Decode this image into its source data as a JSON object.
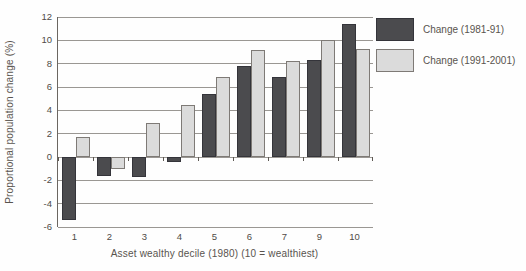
{
  "figure": {
    "y_axis_title": "Proportional population change (%)",
    "x_axis_title": "Asset wealthy decile (1980) (10 = wealthiest)"
  },
  "legend": {
    "position": "top-right",
    "items": [
      {
        "label": "Change (1981-91)",
        "color": "#4b4b4e",
        "border": "#34343a"
      },
      {
        "label": "Change (1991-2001)",
        "color": "#dbdbdb",
        "border": "#7e7a76"
      }
    ]
  },
  "chart_data": {
    "type": "bar",
    "categories": [
      "1",
      "2",
      "3",
      "4",
      "5",
      "6",
      "7",
      "9",
      "10"
    ],
    "series": [
      {
        "name": "Change (1981-91)",
        "values": [
          -5.4,
          -1.6,
          -1.7,
          -0.4,
          5.4,
          7.8,
          6.9,
          8.3,
          11.4
        ],
        "color": "#4b4b4e",
        "border": "#34343a"
      },
      {
        "name": "Change (1991-2001)",
        "values": [
          1.7,
          -1.0,
          2.9,
          4.5,
          6.9,
          9.2,
          8.2,
          10.0,
          9.3
        ],
        "color": "#dbdbdb",
        "border": "#7e7a76"
      }
    ],
    "title": "",
    "xlabel": "Asset wealthy decile (1980) (10 = wealthiest)",
    "ylabel": "Proportional population change (%)",
    "ylim": [
      -6,
      12
    ],
    "yticks": [
      12,
      10,
      8,
      6,
      4,
      2,
      0,
      -2,
      -4,
      -6
    ],
    "grid": true,
    "legend_position": "top-right"
  },
  "colors": {
    "grid": "#9a9793",
    "axis": "#6b6661",
    "text": "#57524c"
  }
}
